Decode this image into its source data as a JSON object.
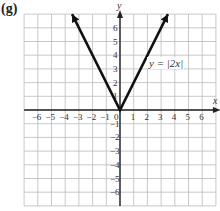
{
  "figure": {
    "label": "(g)",
    "equation": "y = |2x|",
    "x_axis_label": "x",
    "y_axis_label": "y"
  },
  "chart_data": {
    "type": "line",
    "title": "y = |2x|",
    "xlabel": "x",
    "ylabel": "y",
    "xlim": [
      -7,
      7
    ],
    "ylim": [
      -7,
      7
    ],
    "grid": true,
    "x_ticks": [
      -6,
      -5,
      -4,
      -3,
      -2,
      -1,
      0,
      1,
      2,
      3,
      4,
      5,
      6
    ],
    "y_ticks": [
      -6,
      -5,
      -4,
      -3,
      -2,
      -1,
      1,
      2,
      3,
      4,
      5,
      6
    ],
    "series": [
      {
        "name": "y = |2x|",
        "x": [
          -3.5,
          0,
          3.5
        ],
        "y": [
          7,
          0,
          7
        ],
        "arrows": "both ends"
      }
    ]
  }
}
